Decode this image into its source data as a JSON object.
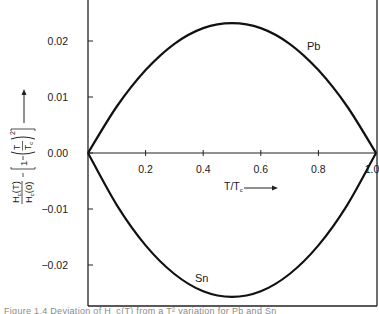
{
  "chart_data": {
    "type": "line",
    "title": "",
    "xlabel": "T/T_c",
    "ylabel": "H_c(T)/H_c(0) − [1 − (T/T_c)^2]",
    "xlim": [
      0,
      1.0
    ],
    "ylim": [
      -0.0273,
      0.027
    ],
    "grid": false,
    "legend": "inline labels on curves",
    "x_ticks": [
      0.2,
      0.4,
      0.6,
      0.8,
      1.0
    ],
    "x_tick_labels": [
      "0.2",
      "0.4",
      "0.6",
      "0.8",
      "1.0"
    ],
    "y_ticks": [
      0.02,
      0.01,
      0.0,
      -0.01,
      -0.02
    ],
    "y_tick_labels": [
      "0.02",
      "0.01",
      "0.00",
      "−0.01",
      "−0.02"
    ],
    "x": [
      0.0,
      0.1,
      0.2,
      0.3,
      0.4,
      0.5,
      0.6,
      0.7,
      0.8,
      0.9,
      1.0
    ],
    "series": [
      {
        "name": "Pb",
        "values": [
          0.0,
          0.0083,
          0.0148,
          0.0195,
          0.0223,
          0.0232,
          0.0223,
          0.0195,
          0.0148,
          0.0083,
          0.0
        ]
      },
      {
        "name": "Sn",
        "values": [
          0.0,
          -0.0093,
          -0.0165,
          -0.0216,
          -0.0247,
          -0.0257,
          -0.0247,
          -0.0216,
          -0.0165,
          -0.0093,
          0.0
        ]
      }
    ],
    "annotations": [
      "zero reference line at y = 0.00",
      "arrow next to T/T_c pointing right",
      "arrow next to y label pointing up"
    ]
  },
  "labels": {
    "x_axis": "T/T",
    "x_axis_sub": "c",
    "y_axis": {
      "num": "H",
      "num_sub": "c",
      "num_tail": "(T)",
      "den": "H",
      "den_sub": "c",
      "den_tail": "(0)",
      "bracket_one": "1",
      "t": "T",
      "tc": "T",
      "tc_sub": "c",
      "exp": "2"
    },
    "pb": "Pb",
    "sn": "Sn"
  },
  "caption": "Figure 1.4  Deviation of H_c(T) from a T² variation for Pb and Sn"
}
